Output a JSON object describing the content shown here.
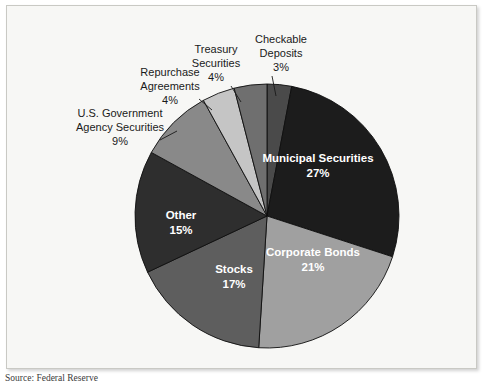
{
  "figure": {
    "source_note": "Source: Federal Reserve",
    "background_color": "#f7f7f5",
    "frame_color": "#c9c9c4"
  },
  "chart_data": {
    "type": "pie",
    "title": "",
    "legend_position": "none",
    "start_angle_deg": 0,
    "direction": "clockwise",
    "center": {
      "x": 267,
      "y": 216
    },
    "radius": 132,
    "categories": [
      "Checkable Deposits",
      "Municipal Securities",
      "Corporate Bonds",
      "Stocks",
      "Other",
      "U.S. Government Agency Securities",
      "Repurchase Agreements",
      "Treasury Securities"
    ],
    "values": [
      3,
      27,
      21,
      17,
      15,
      9,
      4,
      4
    ],
    "value_labels": [
      "3%",
      "27%",
      "21%",
      "17%",
      "15%",
      "9%",
      "4%",
      "4%"
    ],
    "colors": [
      "#4a4a4a",
      "#1c1c1c",
      "#a0a0a0",
      "#5e5e5e",
      "#2e2e2e",
      "#898989",
      "#c5c5c5",
      "#6f6f6f"
    ],
    "slices": [
      {
        "name": "Checkable Deposits",
        "label_line1": "Checkable",
        "label_line2": "Deposits",
        "percent_label": "3%",
        "value": 3,
        "color": "#4a4a4a",
        "label_placement": "outside",
        "label_x": 281,
        "label_y1": 43,
        "label_y2": 57,
        "label_y3": 71,
        "leader": {
          "x1": 272,
          "y1": 76,
          "x2": 276,
          "y2": 96
        }
      },
      {
        "name": "Municipal Securities",
        "label_line1": "Municipal Securities",
        "percent_label": "27%",
        "value": 27,
        "color": "#1c1c1c",
        "label_placement": "inside",
        "label_x": 318,
        "label_y1": 162,
        "label_y2": 177
      },
      {
        "name": "Corporate Bonds",
        "label_line1": "Corporate Bonds",
        "percent_label": "21%",
        "value": 21,
        "color": "#a0a0a0",
        "label_placement": "inside",
        "label_x": 313,
        "label_y1": 256,
        "label_y2": 271
      },
      {
        "name": "Stocks",
        "label_line1": "Stocks",
        "percent_label": "17%",
        "value": 17,
        "color": "#5e5e5e",
        "label_placement": "inside",
        "label_x": 234,
        "label_y1": 273,
        "label_y2": 288
      },
      {
        "name": "Other",
        "label_line1": "Other",
        "percent_label": "15%",
        "value": 15,
        "color": "#2e2e2e",
        "label_placement": "inside",
        "label_x": 181,
        "label_y1": 219,
        "label_y2": 234
      },
      {
        "name": "U.S. Government Agency Securities",
        "label_line1": "U.S. Government",
        "label_line2": "Agency Securities",
        "percent_label": "9%",
        "value": 9,
        "color": "#898989",
        "label_placement": "outside",
        "label_x": 120,
        "label_y1": 117,
        "label_y2": 131,
        "label_y3": 145,
        "leader": {
          "x1": 160,
          "y1": 140,
          "x2": 177,
          "y2": 131
        }
      },
      {
        "name": "Repurchase Agreements",
        "label_line1": "Repurchase",
        "label_line2": "Agreements",
        "percent_label": "4%",
        "value": 4,
        "color": "#c5c5c5",
        "label_placement": "outside",
        "label_x": 170,
        "label_y1": 76,
        "label_y2": 90,
        "label_y3": 104,
        "leader": {
          "x1": 199,
          "y1": 99,
          "x2": 212,
          "y2": 110
        }
      },
      {
        "name": "Treasury Securities",
        "label_line1": "Treasury",
        "label_line2": "Securities",
        "percent_label": "4%",
        "value": 4,
        "color": "#6f6f6f",
        "label_placement": "outside",
        "label_x": 216,
        "label_y1": 53,
        "label_y2": 67,
        "label_y3": 81,
        "leader": {
          "x1": 231,
          "y1": 86,
          "x2": 241,
          "y2": 102
        }
      }
    ]
  }
}
